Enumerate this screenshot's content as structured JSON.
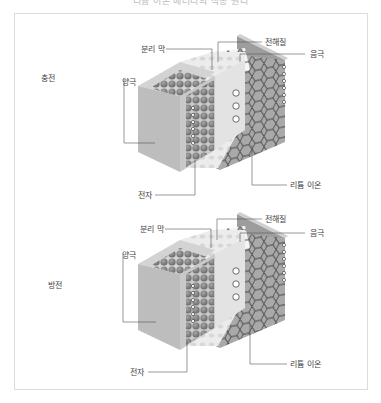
{
  "title": "리튬 이온 배터리의 작동 원리",
  "diagrams": [
    {
      "state": "충전",
      "labels": {
        "separator": "분리 막",
        "electrolyte": "전해질",
        "anode": "음극",
        "cathode": "양극",
        "lithium_ion": "리튬 이온",
        "electron": "전자"
      }
    },
    {
      "state": "방전",
      "labels": {
        "separator": "분리 막",
        "electrolyte": "전해질",
        "anode": "음극",
        "cathode": "양극",
        "lithium_ion": "리튬 이온",
        "electron": "전자"
      }
    }
  ],
  "colors": {
    "frame_border": "#dcdcdc",
    "cathode_face": "#b9b9b9",
    "cathode_spheres": "#8a8a8a",
    "separator_face": "#e9e9e9",
    "anode_face": "#a6a6a6",
    "hexagon_stroke": "#333333",
    "leader_line": "#555555"
  }
}
